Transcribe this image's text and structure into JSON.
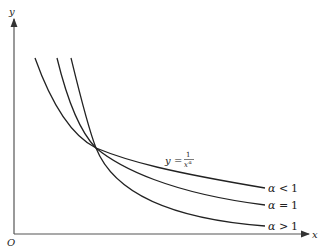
{
  "figure": {
    "axis_labels": {
      "x": "x",
      "y": "y",
      "origin": "O"
    },
    "equation": {
      "lhs": "y",
      "eq": "=",
      "numerator": "1",
      "denominator_base": "x",
      "denominator_exp": "α"
    },
    "curves": [
      {
        "id": "alpha-lt-1",
        "label_sym": "α",
        "label_op": "<",
        "label_val": "1"
      },
      {
        "id": "alpha-eq-1",
        "label_sym": "α",
        "label_op": "=",
        "label_val": "1"
      },
      {
        "id": "alpha-gt-1",
        "label_sym": "α",
        "label_op": ">",
        "label_val": "1"
      }
    ],
    "stroke_color": "#222222"
  }
}
